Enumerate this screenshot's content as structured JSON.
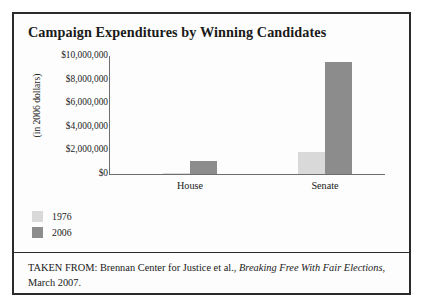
{
  "figure": {
    "title": "Campaign Expenditures by Winning Candidates",
    "source_prefix": "TAKEN FROM: Brennan Center for Justice et al., ",
    "source_italic": "Breaking Free With Fair Elections",
    "source_suffix": ", March 2007."
  },
  "colors": {
    "series_1976": "#d9d9d9",
    "series_2006": "#8c8c8c",
    "axis": "#6e6e6e",
    "border": "#2b2b2b",
    "text": "#1a1a1a"
  },
  "chart_data": {
    "type": "bar",
    "title": "Campaign Expenditures by Winning Candidates",
    "xlabel": "",
    "ylabel": "(in 2006 dollars)",
    "categories": [
      "House",
      "Senate"
    ],
    "series": [
      {
        "name": "1976",
        "values": [
          87000,
          1900000
        ]
      },
      {
        "name": "2006",
        "values": [
          1100000,
          9500000
        ]
      }
    ],
    "ylim": [
      0,
      10000000
    ],
    "yticks": [
      0,
      2000000,
      4000000,
      6000000,
      8000000,
      10000000
    ],
    "ytick_labels": [
      "$0",
      "$2,000,000",
      "$4,000,000",
      "$6,000,000",
      "$8,000,000",
      "$10,000,000"
    ],
    "grid": false,
    "legend_position": "below-left",
    "legend": [
      "1976",
      "2006"
    ]
  }
}
